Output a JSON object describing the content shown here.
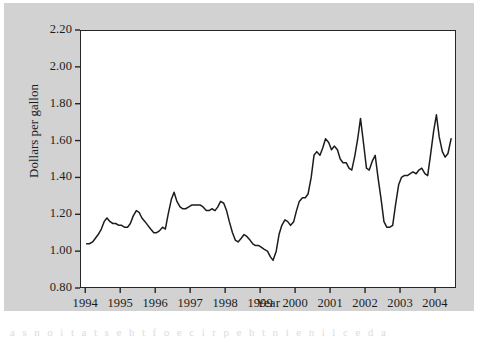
{
  "figure": {
    "background_color": "#d2d2d2",
    "plot_background_color": "#ffffff",
    "frame_color": "#262626",
    "line_color": "#1c1c1c",
    "page_artifact_text": "a  s  n  o  i  t  a  t  s  e  h  t  f  o  e  c  i  r  p  e  h  t  n  i  e  n  i  l  c  e  d  a"
  },
  "chart_data": {
    "type": "line",
    "title": "",
    "subtitle": "",
    "xlabel": "Year",
    "ylabel": "Dollars per gallon",
    "xlim": [
      1993.85,
      2004.6
    ],
    "ylim": [
      0.8,
      2.2
    ],
    "grid": false,
    "legend": null,
    "xticks": [
      1994,
      1995,
      1996,
      1997,
      1998,
      1999,
      2000,
      2001,
      2002,
      2003,
      2004
    ],
    "xtick_labels": [
      "1994",
      "1995",
      "1996",
      "1997",
      "1998",
      "1999",
      "2000",
      "2001",
      "2002",
      "2003",
      "2004"
    ],
    "yticks": [
      0.8,
      1.0,
      1.2,
      1.4,
      1.6,
      1.8,
      2.0,
      2.2
    ],
    "ytick_labels": [
      "0.80",
      "1.00",
      "1.20",
      "1.40",
      "1.60",
      "1.80",
      "2.00",
      "2.20"
    ],
    "series": [
      {
        "name": "Retail gasoline price",
        "color": "#1c1c1c",
        "x": [
          1994.04,
          1994.12,
          1994.21,
          1994.29,
          1994.37,
          1994.46,
          1994.54,
          1994.62,
          1994.71,
          1994.79,
          1994.87,
          1994.96,
          1995.04,
          1995.12,
          1995.21,
          1995.29,
          1995.37,
          1995.46,
          1995.54,
          1995.62,
          1995.71,
          1995.79,
          1995.87,
          1995.96,
          1996.04,
          1996.12,
          1996.21,
          1996.29,
          1996.37,
          1996.46,
          1996.54,
          1996.62,
          1996.71,
          1996.79,
          1996.87,
          1996.96,
          1997.04,
          1997.12,
          1997.21,
          1997.29,
          1997.37,
          1997.46,
          1997.54,
          1997.62,
          1997.71,
          1997.79,
          1997.87,
          1997.96,
          1998.04,
          1998.12,
          1998.21,
          1998.29,
          1998.37,
          1998.46,
          1998.54,
          1998.62,
          1998.71,
          1998.79,
          1998.87,
          1998.96,
          1999.04,
          1999.12,
          1999.21,
          1999.29,
          1999.37,
          1999.46,
          1999.54,
          1999.62,
          1999.71,
          1999.79,
          1999.87,
          1999.96,
          2000.04,
          2000.12,
          2000.21,
          2000.29,
          2000.37,
          2000.46,
          2000.54,
          2000.62,
          2000.71,
          2000.79,
          2000.87,
          2000.96,
          2001.04,
          2001.12,
          2001.21,
          2001.29,
          2001.37,
          2001.46,
          2001.54,
          2001.62,
          2001.71,
          2001.79,
          2001.87,
          2001.96,
          2002.04,
          2002.12,
          2002.21,
          2002.29,
          2002.37,
          2002.46,
          2002.54,
          2002.62,
          2002.71,
          2002.79,
          2002.87,
          2002.96,
          2003.04,
          2003.12,
          2003.21,
          2003.29,
          2003.37,
          2003.46,
          2003.54,
          2003.62,
          2003.71,
          2003.79,
          2003.87,
          2003.96,
          2004.04,
          2004.12,
          2004.21,
          2004.29,
          2004.37,
          2004.46
        ],
        "y": [
          1.04,
          1.04,
          1.05,
          1.07,
          1.09,
          1.12,
          1.16,
          1.18,
          1.16,
          1.15,
          1.15,
          1.14,
          1.14,
          1.13,
          1.13,
          1.15,
          1.19,
          1.22,
          1.21,
          1.18,
          1.16,
          1.14,
          1.12,
          1.1,
          1.1,
          1.11,
          1.13,
          1.12,
          1.2,
          1.28,
          1.32,
          1.27,
          1.24,
          1.23,
          1.23,
          1.24,
          1.25,
          1.25,
          1.25,
          1.25,
          1.24,
          1.22,
          1.22,
          1.23,
          1.22,
          1.24,
          1.27,
          1.26,
          1.22,
          1.16,
          1.1,
          1.06,
          1.05,
          1.07,
          1.09,
          1.08,
          1.06,
          1.04,
          1.03,
          1.03,
          1.02,
          1.01,
          1.0,
          0.97,
          0.95,
          1.0,
          1.09,
          1.14,
          1.17,
          1.16,
          1.14,
          1.16,
          1.22,
          1.27,
          1.29,
          1.29,
          1.31,
          1.4,
          1.52,
          1.54,
          1.52,
          1.56,
          1.61,
          1.59,
          1.55,
          1.57,
          1.55,
          1.5,
          1.48,
          1.48,
          1.45,
          1.44,
          1.52,
          1.61,
          1.72,
          1.58,
          1.45,
          1.44,
          1.49,
          1.52,
          1.4,
          1.28,
          1.16,
          1.13,
          1.13,
          1.14,
          1.25,
          1.36,
          1.4,
          1.41,
          1.41,
          1.42,
          1.43,
          1.42,
          1.44,
          1.45,
          1.42,
          1.41,
          1.52,
          1.65,
          1.74,
          1.62,
          1.54,
          1.51,
          1.53,
          1.61
        ]
      }
    ],
    "annotations": [
      {
        "label": "series minimum",
        "x": 1999.37,
        "y": 0.95
      },
      {
        "label": "series maximum",
        "x": 2004.37,
        "y": 2.05
      },
      {
        "label": "2001 spike",
        "x": 2001.87,
        "y": 1.72
      },
      {
        "label": "2002 trough",
        "x": 2002.62,
        "y": 1.13
      }
    ]
  }
}
